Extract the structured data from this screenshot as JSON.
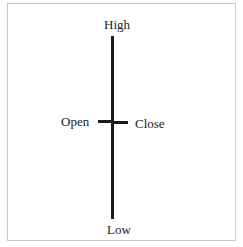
{
  "diagram": {
    "type": "ohlc-bar",
    "labels": {
      "high": "High",
      "low": "Low",
      "open": "Open",
      "close": "Close"
    },
    "colors": {
      "bar": "#1a1a1a",
      "border": "#c8c8c8",
      "background": "#ffffff"
    }
  }
}
